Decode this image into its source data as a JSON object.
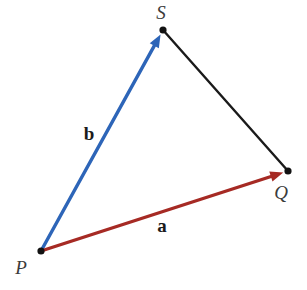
{
  "diagram": {
    "width": 307,
    "height": 290,
    "background": "#ffffff",
    "dot_color": "#121212",
    "dot_radius": 3.6,
    "point_label_color": "#3b3b3b",
    "vector_label_color": "#1b1b1b",
    "points": [
      {
        "id": "P",
        "label": "P",
        "x": 41,
        "y": 251,
        "label_x": 21,
        "label_y": 267
      },
      {
        "id": "S",
        "label": "S",
        "x": 163,
        "y": 30,
        "label_x": 161,
        "label_y": 12
      },
      {
        "id": "Q",
        "label": "Q",
        "x": 288,
        "y": 171,
        "label_x": 281,
        "label_y": 192
      }
    ],
    "edges": [
      {
        "id": "segment-SQ",
        "from": "S",
        "to": "Q",
        "color": "#1a1a1a",
        "stroke_width": 2.4,
        "arrow": false,
        "label": ""
      },
      {
        "id": "vector-b",
        "from": "P",
        "to": "S",
        "color": "#2d65b8",
        "stroke_width": 3.4,
        "arrow": true,
        "label": "b",
        "label_x": 89,
        "label_y": 133
      },
      {
        "id": "vector-a",
        "from": "P",
        "to": "Q",
        "color": "#a62a24",
        "stroke_width": 3.4,
        "arrow": true,
        "label": "a",
        "label_x": 162,
        "label_y": 225
      }
    ],
    "arrowhead": {
      "length": 13,
      "half_width": 5.2,
      "tip_offset": 5
    }
  }
}
